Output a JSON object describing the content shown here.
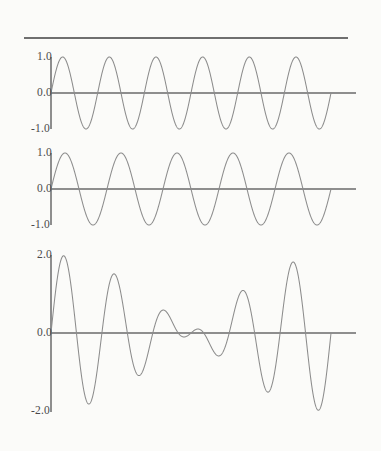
{
  "figure": {
    "width": 381,
    "height": 451,
    "background_color": "#fbfbf9",
    "curve_color": "#8c8c8c",
    "axis_color": "#6a6a6a",
    "label_color": "#4a4a4a",
    "top_rule": {
      "x": 24,
      "y": 37,
      "width": 324,
      "thickness": 2
    }
  },
  "chart_data": [
    {
      "type": "line",
      "name": "panel-1-sine-6",
      "title": "",
      "xlabel": "",
      "ylabel": "",
      "ylim": [
        -1.0,
        1.0
      ],
      "xlim": [
        0,
        6.0
      ],
      "yticks": [
        1.0,
        0.0,
        -1.0
      ],
      "ytick_labels": [
        "1.0",
        "0.0",
        "-1.0"
      ],
      "xticks": [],
      "grid": false,
      "legend": "none",
      "cycles": 6,
      "amplitude": 1.0,
      "function": "sin(2*pi*6*t)",
      "trailing_flat_fraction": 0.082,
      "geometry": {
        "axis_x": 51,
        "baseline_y": 93,
        "plot_left": 51,
        "plot_right": 331,
        "flat_right": 356,
        "axis_top": 57,
        "axis_bottom": 129,
        "unit_px": 36
      },
      "labels": [
        {
          "text": "1.0",
          "value": 1.0,
          "x": 18,
          "y": 51
        },
        {
          "text": "0.0",
          "value": 0.0,
          "x": 18,
          "y": 87
        },
        {
          "text": "-1.0",
          "value": -1.0,
          "x": 16,
          "y": 123
        }
      ]
    },
    {
      "type": "line",
      "name": "panel-2-sine-5",
      "title": "",
      "xlabel": "",
      "ylabel": "",
      "ylim": [
        -1.0,
        1.0
      ],
      "xlim": [
        0,
        6.0
      ],
      "yticks": [
        1.0,
        0.0,
        -1.0
      ],
      "ytick_labels": [
        "1.0",
        "0.0",
        "-1.0"
      ],
      "xticks": [],
      "grid": false,
      "legend": "none",
      "cycles": 5,
      "amplitude": 1.0,
      "function": "sin(2*pi*5*t)",
      "trailing_flat_fraction": 0.082,
      "geometry": {
        "axis_x": 51,
        "baseline_y": 189,
        "plot_left": 51,
        "plot_right": 331,
        "flat_right": 356,
        "axis_top": 153,
        "axis_bottom": 225,
        "unit_px": 36
      },
      "labels": [
        {
          "text": "1.0",
          "value": 1.0,
          "x": 18,
          "y": 147
        },
        {
          "text": "0.0",
          "value": 0.0,
          "x": 18,
          "y": 183
        },
        {
          "text": "-1.0",
          "value": -1.0,
          "x": 16,
          "y": 219
        }
      ]
    },
    {
      "type": "line",
      "name": "panel-3-sum",
      "title": "",
      "xlabel": "",
      "ylabel": "",
      "ylim": [
        -2.0,
        2.0
      ],
      "xlim": [
        0,
        6.0
      ],
      "yticks": [
        2.0,
        0.0,
        -2.0
      ],
      "ytick_labels": [
        "2.0",
        "0.0",
        "-2.0"
      ],
      "xticks": [],
      "grid": false,
      "legend": "none",
      "cycles": 0,
      "amplitude": 2.0,
      "function": "sin(2*pi*6*t) + sin(2*pi*5*t)",
      "trailing_flat_fraction": 0.082,
      "geometry": {
        "axis_x": 51,
        "baseline_y": 333,
        "plot_left": 51,
        "plot_right": 331,
        "flat_right": 356,
        "axis_top": 255,
        "axis_bottom": 412,
        "unit_px": 39
      },
      "labels": [
        {
          "text": "2.0",
          "value": 2.0,
          "x": 18,
          "y": 249
        },
        {
          "text": "0.0",
          "value": 0.0,
          "x": 18,
          "y": 327
        },
        {
          "text": "-2.0",
          "value": -2.0,
          "x": 16,
          "y": 405
        }
      ]
    }
  ]
}
